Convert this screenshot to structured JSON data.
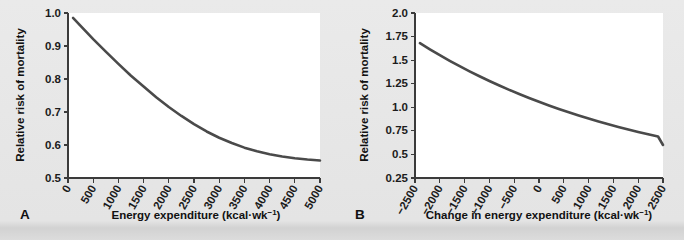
{
  "figure": {
    "background_color": "#e6e6e6",
    "curve_color": "#4a4a4a",
    "axis_color": "#3b3b3b",
    "plot_background": "#ffffff"
  },
  "panels": [
    {
      "letter": "A",
      "ylabel": "Relative risk of mortality",
      "xlabel_main": "Energy expenditure (kcal·wk",
      "xlabel_sup": "−1",
      "xlabel_tail": ")",
      "xlabel_full": "Energy expenditure (kcal·wk−1)"
    },
    {
      "letter": "B",
      "ylabel": "Relative risk of mortality",
      "xlabel_main": "Change in energy expenditure (kcal·wk",
      "xlabel_sup": "−1",
      "xlabel_tail": ")",
      "xlabel_full": "Change in energy expenditure (kcal·wk−1)"
    }
  ],
  "chart_data": [
    {
      "type": "line",
      "panel": "A",
      "title": "",
      "xlabel": "Energy expenditure (kcal·wk−1)",
      "ylabel": "Relative risk of mortality",
      "xlim": [
        0,
        5000
      ],
      "ylim": [
        0.5,
        1.0
      ],
      "grid": false,
      "legend": "none",
      "xticks": [
        0,
        500,
        1000,
        1500,
        2000,
        2500,
        3000,
        3500,
        4000,
        4500,
        5000
      ],
      "xtick_labels": [
        "0",
        "500",
        "1000",
        "1500",
        "2000",
        "2500",
        "3000",
        "3500",
        "4000",
        "4500",
        "5000"
      ],
      "yticks": [
        0.5,
        0.6,
        0.7,
        0.8,
        0.9,
        1.0
      ],
      "ytick_labels": [
        "0.5",
        "0.6",
        "0.7",
        "0.8",
        "0.9",
        "1.0"
      ],
      "series": [
        {
          "name": "Relative risk",
          "x": [
            100,
            250,
            500,
            750,
            1000,
            1250,
            1500,
            1750,
            2000,
            2250,
            2500,
            2750,
            3000,
            3250,
            3500,
            3750,
            4000,
            4250,
            4500,
            4750,
            5000
          ],
          "y": [
            0.985,
            0.961,
            0.921,
            0.883,
            0.846,
            0.81,
            0.777,
            0.745,
            0.715,
            0.688,
            0.663,
            0.641,
            0.622,
            0.606,
            0.592,
            0.581,
            0.572,
            0.565,
            0.56,
            0.556,
            0.553
          ]
        }
      ]
    },
    {
      "type": "line",
      "panel": "B",
      "title": "",
      "xlabel": "Change in energy expenditure (kcal·wk−1)",
      "ylabel": "Relative risk of mortality",
      "xlim": [
        -2500,
        2500
      ],
      "ylim": [
        0.25,
        2.0
      ],
      "grid": false,
      "legend": "none",
      "xticks": [
        -2500,
        -2000,
        -1500,
        -1000,
        -500,
        0,
        500,
        1000,
        1500,
        2000,
        2500
      ],
      "xtick_labels": [
        "−2500",
        "−2000",
        "−1500",
        "−1000",
        "−500",
        "0",
        "500",
        "1000",
        "1500",
        "2000",
        "2500"
      ],
      "yticks": [
        0.25,
        0.5,
        0.75,
        1.0,
        1.25,
        1.5,
        1.75,
        2.0
      ],
      "ytick_labels": [
        "0.25",
        "0.5",
        "0.75",
        "1.0",
        "1.25",
        "1.5",
        "1.75",
        "2.0"
      ],
      "series": [
        {
          "name": "Relative risk",
          "x": [
            -2400,
            -2200,
            -2000,
            -1800,
            -1600,
            -1400,
            -1200,
            -1000,
            -800,
            -600,
            -400,
            -200,
            0,
            200,
            400,
            600,
            800,
            1000,
            1200,
            1400,
            1600,
            1800,
            2000,
            2200,
            2400,
            2500
          ],
          "y": [
            1.68,
            1.615,
            1.553,
            1.493,
            1.436,
            1.381,
            1.329,
            1.279,
            1.231,
            1.185,
            1.141,
            1.099,
            1.058,
            1.019,
            0.982,
            0.947,
            0.913,
            0.88,
            0.849,
            0.819,
            0.791,
            0.764,
            0.738,
            0.713,
            0.69,
            0.6
          ]
        }
      ]
    }
  ]
}
